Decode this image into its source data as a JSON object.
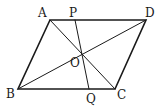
{
  "diagram": {
    "type": "geometry",
    "colors": {
      "stroke": "#1a1a1a",
      "background": "#ffffff"
    },
    "points": {
      "A": {
        "label": "A",
        "x": 50,
        "y": 20,
        "lx": 38,
        "ly": 17
      },
      "P": {
        "label": "P",
        "x": 75,
        "y": 20,
        "lx": 69,
        "ly": 17
      },
      "D": {
        "label": "D",
        "x": 146,
        "y": 20,
        "lx": 145,
        "ly": 17
      },
      "O": {
        "label": "O",
        "x": 81,
        "y": 55,
        "lx": 70,
        "ly": 67
      },
      "B": {
        "label": "B",
        "x": 18,
        "y": 89,
        "lx": 6,
        "ly": 98
      },
      "Q": {
        "label": "Q",
        "x": 89,
        "y": 89,
        "lx": 86,
        "ly": 103
      },
      "C": {
        "label": "C",
        "x": 115,
        "y": 89,
        "lx": 117,
        "ly": 99
      }
    },
    "segments": [
      "AD",
      "DC",
      "CB",
      "BA",
      "AC",
      "BD",
      "PQ"
    ]
  }
}
